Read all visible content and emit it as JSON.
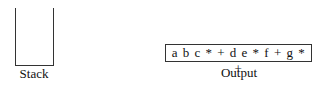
{
  "stack": {
    "label": "Stack",
    "items": []
  },
  "output": {
    "label": "Output",
    "expression": "a b c * + d e * f + g * +"
  }
}
